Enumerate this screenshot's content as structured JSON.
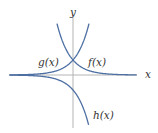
{
  "chart_data": {
    "type": "line",
    "title": "",
    "xlabel": "x",
    "ylabel": "y",
    "grid": false,
    "legend": "none (curves labeled inline)",
    "axis_ranges": {
      "x": [
        -4.8,
        4.9
      ],
      "y": [
        -3.5,
        4.1
      ]
    },
    "series": [
      {
        "name": "f(x)",
        "label": "f(x)",
        "formula": "e^(-x)",
        "x": [
          -1.2,
          -1,
          -0.5,
          0,
          0.5,
          1,
          2,
          3,
          4,
          4.9
        ],
        "y": [
          3.32,
          2.72,
          1.65,
          1,
          0.61,
          0.37,
          0.14,
          0.05,
          0.02,
          0.01
        ]
      },
      {
        "name": "g(x)",
        "label": "g(x)",
        "formula": "e^(x)",
        "x": [
          -4.8,
          -4,
          -3,
          -2,
          -1,
          -0.5,
          0,
          0.5,
          1,
          1.2
        ],
        "y": [
          0.01,
          0.02,
          0.05,
          0.14,
          0.37,
          0.61,
          1,
          1.65,
          2.72,
          3.32
        ]
      },
      {
        "name": "h(x)",
        "label": "h(x)",
        "formula": "-e^(x)",
        "x": [
          -4.8,
          -4,
          -3,
          -2,
          -1,
          -0.5,
          0,
          0.5,
          1,
          1.2
        ],
        "y": [
          -0.01,
          -0.02,
          -0.05,
          -0.14,
          -0.37,
          -0.61,
          -1,
          -1.65,
          -2.72,
          -3.32
        ]
      }
    ],
    "annotations": [
      {
        "text": "f(x)",
        "near": "right of intersection (0,1)"
      },
      {
        "text": "g(x)",
        "near": "left of intersection (0,1)"
      },
      {
        "text": "h(x)",
        "near": "lower right, end of h curve"
      }
    ],
    "colors": {
      "curves": "#4d6fa3",
      "axes": "#b4b4b4"
    }
  },
  "labels": {
    "x_axis": "x",
    "y_axis": "y",
    "f": "f(x)",
    "g": "g(x)",
    "h": "h(x)"
  }
}
